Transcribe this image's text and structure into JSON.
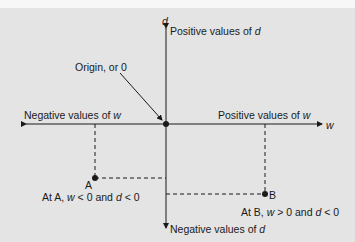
{
  "diagram": {
    "axis_labels": {
      "horizontal": "w",
      "vertical": "d"
    },
    "region_labels": {
      "positive_d": {
        "text": "Positive values of ",
        "var": "d"
      },
      "negative_d": {
        "text": "Negative values of ",
        "var": "d"
      },
      "positive_w": {
        "text": "Positive values of ",
        "var": "w"
      },
      "negative_w": {
        "text": "Negative values of ",
        "var": "w"
      }
    },
    "origin_label": "Origin, or 0",
    "points": [
      {
        "name": "A",
        "caption_prefix": "At A, ",
        "w_var": "w",
        "w_rel": " < 0 and ",
        "d_var": "d",
        "d_rel": " < 0"
      },
      {
        "name": "B",
        "caption_prefix": "At B, ",
        "w_var": "w",
        "w_rel": " > 0 and ",
        "d_var": "d",
        "d_rel": " < 0"
      }
    ],
    "colors": {
      "background": "#e4e4e4",
      "ink": "#1a1a1a"
    }
  }
}
